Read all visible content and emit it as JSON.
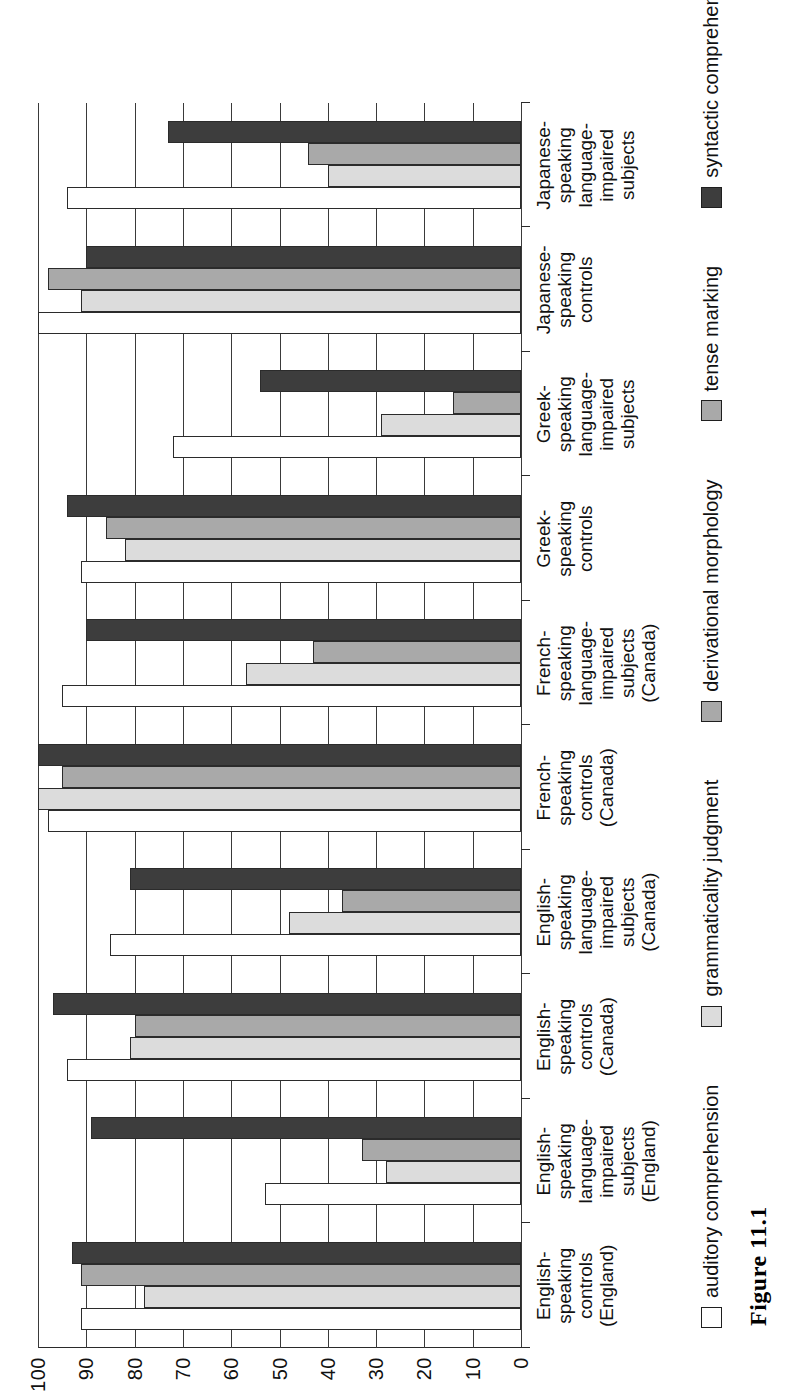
{
  "caption": "Figure 11.1",
  "chart_data": {
    "type": "bar",
    "orientation": "horizontal-printed-sideways",
    "title": "",
    "xlabel": "",
    "ylabel": "",
    "ylim": [
      0,
      100
    ],
    "yticks": [
      100,
      90,
      80,
      70,
      60,
      50,
      40,
      30,
      20,
      10,
      0
    ],
    "grid": true,
    "legend_position": "bottom",
    "categories": [
      "English-speaking controls (England)",
      "English-speaking language-impaired subjects (England)",
      "English-speaking controls (Canada)",
      "English-speaking language-impaired subjects (Canada)",
      "French-speaking controls (Canada)",
      "French-speaking language-impaired subjects (Canada)",
      "Greek-speaking controls",
      "Greek-speaking language-impaired subjects",
      "Japanese-speaking controls",
      "Japanese-speaking language-impaired subjects"
    ],
    "category_lines": [
      [
        "English-",
        "speaking",
        "controls",
        "(England)"
      ],
      [
        "English-",
        "speaking",
        "language-",
        "impaired",
        "subjects",
        "(England)"
      ],
      [
        "English-",
        "speaking",
        "controls",
        "(Canada)"
      ],
      [
        "English-",
        "speaking",
        "language-",
        "impaired",
        "subjects",
        "(Canada)"
      ],
      [
        "French-",
        "speaking",
        "controls",
        "(Canada)"
      ],
      [
        "French-",
        "speaking",
        "language-",
        "impaired",
        "subjects",
        "(Canada)"
      ],
      [
        "Greek-",
        "speaking",
        "controls"
      ],
      [
        "Greek-",
        "speaking",
        "language-",
        "impaired",
        "subjects"
      ],
      [
        "Japanese-",
        "speaking",
        "controls"
      ],
      [
        "Japanese-",
        "speaking",
        "language-",
        "impaired",
        "subjects"
      ]
    ],
    "series": [
      {
        "name": "auditory comprehension",
        "color": "#ffffff",
        "values": [
          91,
          53,
          94,
          85,
          98,
          95,
          91,
          72,
          100,
          94
        ]
      },
      {
        "name": "grammaticality judgment",
        "color": "#dcdcdc",
        "values": [
          78,
          28,
          81,
          48,
          100,
          57,
          82,
          29,
          91,
          40
        ]
      },
      {
        "name": "derivational morphology",
        "color": "#a9a9a9",
        "values": [
          91,
          33,
          80,
          37,
          95,
          43,
          86,
          14,
          98,
          44
        ]
      },
      {
        "name": "tense marking",
        "color": "#3d3d3d",
        "values": [
          93,
          89,
          97,
          81,
          100,
          90,
          94,
          54,
          90,
          73
        ]
      }
    ],
    "legend": [
      {
        "label": "auditory comprehension",
        "color": "#ffffff"
      },
      {
        "label": "grammaticality judgment",
        "color": "#dcdcdc"
      },
      {
        "label": "derivational morphology",
        "color": "#a9a9a9"
      },
      {
        "label": "tense marking",
        "color": "#a9a9a9"
      },
      {
        "label": "syntactic comprehension",
        "color": "#3d3d3d"
      }
    ],
    "legend_row": [
      {
        "label": "auditory comprehension",
        "swatch": "s0"
      },
      {
        "label": "grammaticality judgment",
        "swatch": "s1"
      },
      {
        "label": "derivational morphology",
        "swatch": "s2"
      },
      {
        "label": "tense marking",
        "swatch": "s2"
      },
      {
        "label": "syntactic comprehension",
        "swatch": "s3"
      }
    ]
  }
}
